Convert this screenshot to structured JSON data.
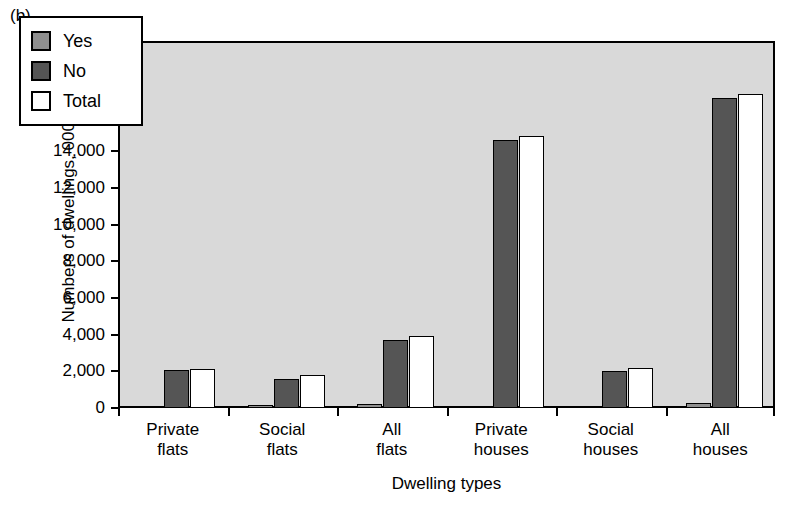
{
  "figure": {
    "panel_label": "(b)",
    "xlabel": "Dwelling types",
    "ylabel": "Numbers of dwellings, 000s"
  },
  "legend": {
    "position": "top-left-inside",
    "items": [
      {
        "label": "Yes",
        "color": "#8f8f8f"
      },
      {
        "label": "No",
        "color": "#555555"
      },
      {
        "label": "Total",
        "color": "#ffffff"
      }
    ]
  },
  "axis": {
    "y_ticks": [
      "0",
      "2,000",
      "4,000",
      "6,000",
      "8,000",
      "10,000",
      "12,000",
      "14,000",
      "16,000",
      "18,000",
      "20,000"
    ],
    "y_min": 0,
    "y_max": 20000,
    "y_step": 2000,
    "plot_background": "#d9d9d9",
    "frame_color": "#000000"
  },
  "chart_data": {
    "type": "bar",
    "title": "",
    "subtitle": "",
    "panel": "(b)",
    "xlabel": "Dwelling types",
    "ylabel": "Numbers of dwellings, 000s",
    "ylim": [
      0,
      20000
    ],
    "ytick_step": 2000,
    "grid": false,
    "legend_position": "upper left",
    "categories": [
      "Private flats",
      "Social flats",
      "All flats",
      "Private houses",
      "Social houses",
      "All houses"
    ],
    "category_lines": [
      [
        "Private",
        "flats"
      ],
      [
        "Social",
        "flats"
      ],
      [
        "All",
        "flats"
      ],
      [
        "Private",
        "houses"
      ],
      [
        "Social",
        "houses"
      ],
      [
        "All",
        "houses"
      ]
    ],
    "series": [
      {
        "name": "Yes",
        "color": "#8f8f8f",
        "values": [
          100,
          150,
          200,
          120,
          130,
          250
        ]
      },
      {
        "name": "No",
        "color": "#555555",
        "values": [
          2050,
          1570,
          3700,
          14600,
          2020,
          16900
        ]
      },
      {
        "name": "Total",
        "color": "#ffffff",
        "values": [
          2100,
          1780,
          3900,
          14800,
          2180,
          17100
        ]
      }
    ]
  }
}
